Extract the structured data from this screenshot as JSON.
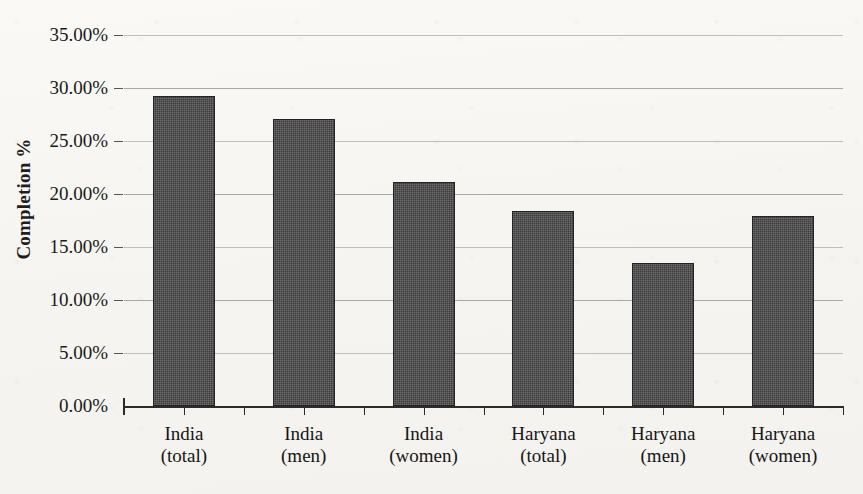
{
  "chart_data": {
    "type": "bar",
    "title": "",
    "xlabel": "",
    "ylabel": "Completion %",
    "categories": [
      "India (total)",
      "India (men)",
      "India (women)",
      "Haryana (total)",
      "Haryana (men)",
      "Haryana (women)"
    ],
    "category_lines": [
      [
        "India",
        "(total)"
      ],
      [
        "India",
        "(men)"
      ],
      [
        "India",
        "(women)"
      ],
      [
        "Haryana",
        "(total)"
      ],
      [
        "Haryana",
        "(men)"
      ],
      [
        "Haryana",
        "(women)"
      ]
    ],
    "values": [
      29.2,
      27.1,
      21.1,
      18.4,
      13.5,
      17.9
    ],
    "value_labels": [
      "29.2%",
      "27.1%",
      "21.1%",
      "18.4%",
      "13.5%",
      "17.9%"
    ],
    "ylim": [
      0,
      35
    ],
    "ytick_values": [
      0,
      5,
      10,
      15,
      20,
      25,
      30,
      35
    ],
    "ytick_labels": [
      "0.00%",
      "5.00%",
      "10.00%",
      "15.00%",
      "20.00%",
      "25.00%",
      "30.00%",
      "35.00%"
    ],
    "grid": true,
    "legend": "none",
    "series": [
      {
        "name": "Completion %",
        "values": [
          29.2,
          27.1,
          21.1,
          18.4,
          13.5,
          17.9
        ]
      }
    ]
  },
  "style": {
    "bar_color": "#3b3b3b",
    "bar_border_color": "#232323",
    "grid_color": "#9a9a98",
    "axis_color": "#2b2b2b",
    "background_color": "#f7f6f3",
    "text_color": "#161616"
  }
}
